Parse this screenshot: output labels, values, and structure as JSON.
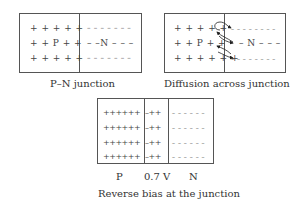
{
  "panels": [
    {
      "id": "pn-junction",
      "caption": "P–N junction",
      "p_rows": [
        "+ + + + +",
        "+ + P + +",
        "+ + + + +"
      ],
      "n_rows": [
        "– – – – – – –",
        "– –N – – –",
        "– – – – – – –"
      ],
      "p_label": "P",
      "n_label": "N"
    },
    {
      "id": "diffusion",
      "caption": "Diffusion across junction",
      "p_rows": [
        "+ + + + +",
        "+ + P + +",
        "+ + + + + +"
      ],
      "n_rows": [
        "– – – – – – – –",
        "– N – – –",
        "– – – – – – – –"
      ],
      "arrows": "curved diffusion arrows crossing the junction in both directions"
    },
    {
      "id": "reverse-bias",
      "caption": "Reverse bias at the junction",
      "p_rows": [
        "++++++",
        "++++++",
        "++++++",
        "++++++"
      ],
      "depletion_rows": [
        "–++",
        "–++",
        "–++",
        "–++"
      ],
      "n_rows": [
        "– – – – – –",
        "– – – – – –",
        "– – – – – –",
        "– – – – – –"
      ],
      "bottom_labels": [
        "P",
        "0.7 V",
        "N"
      ]
    }
  ]
}
